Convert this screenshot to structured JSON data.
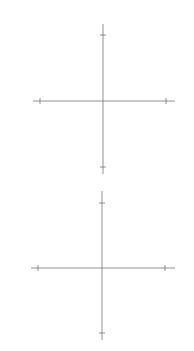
{
  "chart_data": [
    {
      "type": "line",
      "title": "",
      "xlabel": "x",
      "ylabel": "y",
      "xlim": [
        -1000,
        1000
      ],
      "ylim": [
        -1000000000,
        1000000000
      ],
      "x_ticks": [
        {
          "value": -1000,
          "label": "−1000"
        },
        {
          "value": 1000,
          "label": "1000"
        }
      ],
      "y_ticks": [
        {
          "value": 1000000000,
          "label": "10",
          "exp": "9"
        },
        {
          "value": -1000000000,
          "label": "−10",
          "exp": "9"
        }
      ],
      "grid": false,
      "series": [
        {
          "name": "y = x^3",
          "expr": "x^3"
        },
        {
          "name": "y = x^3 + 10^6 x",
          "expr": "x^3 + 1e6*x"
        },
        {
          "name": "y = x^3 − 10^6 x",
          "expr": "x^3 - 1e6*x"
        }
      ]
    },
    {
      "type": "line",
      "title": "",
      "xlabel": "x",
      "ylabel": "y",
      "xlim": [
        -100000,
        100000
      ],
      "ylim": [
        -1000000000000000.0,
        1000000000000000.0
      ],
      "x_ticks": [
        {
          "value": -100000,
          "label": "−10",
          "exp": "5"
        },
        {
          "value": 100000,
          "label": "10",
          "exp": "5"
        }
      ],
      "y_ticks": [
        {
          "value": 1000000000000000.0,
          "label": "10",
          "exp": "15"
        },
        {
          "value": -1000000000000000.0,
          "label": "−10",
          "exp": "15"
        }
      ],
      "grid": false,
      "series": [
        {
          "name": "y = x^3",
          "expr": "x^3"
        }
      ]
    }
  ],
  "labels": {
    "x": "x",
    "y": "y",
    "top_xneg": "−1000",
    "top_xpos": "1000",
    "top_ypos_base": "10",
    "top_ypos_exp": "9",
    "top_yneg_base": "−10",
    "top_yneg_exp": "9",
    "bot_xneg_base": "−10",
    "bot_xneg_exp": "5",
    "bot_xpos_base": "10",
    "bot_xpos_exp": "5",
    "bot_ypos_base": "10",
    "bot_ypos_exp": "15",
    "bot_yneg_base": "−10",
    "bot_yneg_exp": "15"
  }
}
